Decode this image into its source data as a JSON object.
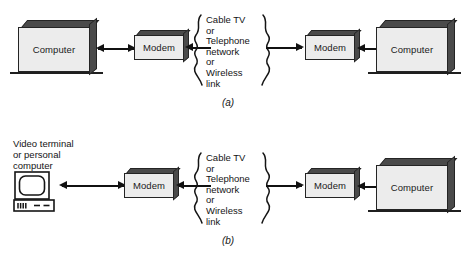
{
  "figure": {
    "panels": [
      {
        "id": "a",
        "caption": "(a)",
        "left_node": {
          "label": "Computer",
          "type": "computer-box"
        },
        "left_modem": {
          "label": "Modem"
        },
        "network": {
          "lines": [
            "Cable TV",
            "or",
            "Telephone",
            "network",
            "or",
            "Wireless",
            "link"
          ]
        },
        "right_modem": {
          "label": "Modem"
        },
        "right_node": {
          "label": "Computer",
          "type": "computer-box"
        }
      },
      {
        "id": "b",
        "caption": "(b)",
        "left_node": {
          "label_lines": [
            "Video terminal",
            "or personal",
            "computer"
          ],
          "type": "video-terminal"
        },
        "left_modem": {
          "label": "Modem"
        },
        "network": {
          "lines": [
            "Cable TV",
            "or",
            "Telephone",
            "network",
            "or",
            "Wireless",
            "link"
          ]
        },
        "right_modem": {
          "label": "Modem"
        },
        "right_node": {
          "label": "Computer",
          "type": "computer-box"
        }
      }
    ]
  },
  "colors": {
    "box_face": "#ececec",
    "box_shadow": "#4a4a4a",
    "outline": "#242424",
    "connector": "#111111",
    "background": "#ffffff"
  }
}
